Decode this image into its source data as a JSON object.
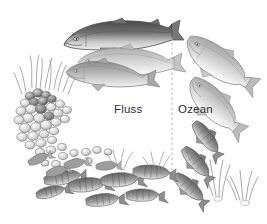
{
  "figure": {
    "style": "pencil-graphite-scientific-illustration",
    "background_color": "#ffffff",
    "width": 267,
    "height": 224,
    "arrangement": "circular-life-cycle-counterclockwise"
  },
  "labels": {
    "river": "Fluss",
    "ocean": "Ozean"
  },
  "divider": {
    "name": "habitat-divider",
    "style": "dotted-vertical-line",
    "color": "#b9b9b9",
    "x": 172,
    "y_start": 38,
    "y_end": 172
  },
  "colors": {
    "background": "#ffffff",
    "ink_dark": "#3a3a3a",
    "ink_mid": "#7b7b7b",
    "ink_light": "#bdbdbd",
    "ink_wash": "#d8d8d8",
    "label_text": "#2e2e2e",
    "divider": "#b9b9b9"
  },
  "scene_elements": [
    {
      "name": "adult-salmon-large",
      "stage": "adult",
      "habitat": "Fluss",
      "count": 1,
      "position": "top-center",
      "description": "Large adult salmon with dark charcoal back, hooked jaw, forked tail, swimming left"
    },
    {
      "name": "adult-salmon-middle",
      "stage": "adult",
      "habitat": "Fluss",
      "count": 1,
      "position": "top-center-lower",
      "description": "Second adult salmon in pale grey wash below the largest fish"
    },
    {
      "name": "adult-salmon-small",
      "stage": "adult",
      "habitat": "Fluss",
      "count": 1,
      "position": "top-left-lower",
      "description": "Third smaller adult salmon angled downward-left"
    },
    {
      "name": "ocean-salmon-upper",
      "stage": "ocean-adult",
      "habitat": "Ozean",
      "count": 1,
      "position": "upper-right",
      "description": "Silvery ocean-phase salmon angled down-right with visible eye and forked tail"
    },
    {
      "name": "ocean-salmon-lower",
      "stage": "ocean-adult",
      "habitat": "Ozean",
      "count": 1,
      "position": "right",
      "description": "Second silvery ocean-phase salmon angled down-right"
    },
    {
      "name": "smolt-group",
      "stage": "smolt",
      "habitat": "Ozean",
      "count": 3,
      "position": "lower-right",
      "description": "Small dark-speckled smolts descending toward the sea"
    },
    {
      "name": "seaweed-cluster",
      "stage": "habitat-vegetation",
      "habitat": "Ozean",
      "count": 2,
      "position": "lower-right",
      "description": "Slender kelp and seaweed blades rising from the seabed"
    },
    {
      "name": "gravel-redd",
      "stage": "eggs",
      "habitat": "Fluss",
      "count": 1,
      "position": "left",
      "description": "Gravel nest (redd) of rounded pebbles with salmon eggs tucked between stones"
    },
    {
      "name": "river-grass",
      "stage": "habitat-vegetation",
      "habitat": "Fluss",
      "count": 1,
      "position": "upper-left",
      "description": "Tufts of river grass growing above the gravel redd"
    },
    {
      "name": "alevin-fry-group",
      "stage": "alevin-fry",
      "habitat": "Fluss",
      "count": 6,
      "position": "bottom-left",
      "description": "Newly hatched alevins and fry among streambed pebbles"
    },
    {
      "name": "parr-group",
      "stage": "parr",
      "habitat": "Fluss",
      "count": 7,
      "position": "bottom-center",
      "description": "Juvenile parr with dark vertical bars swimming along the riverbed"
    },
    {
      "name": "streambed-pebbles",
      "stage": "habitat-substrate",
      "habitat": "Fluss",
      "count": 1,
      "position": "bottom-left-arc",
      "description": "Scattered rounded pebbles forming the streambed arc"
    }
  ]
}
